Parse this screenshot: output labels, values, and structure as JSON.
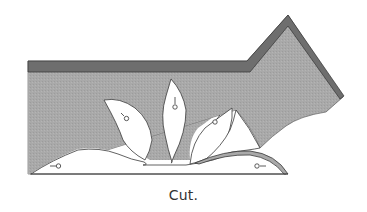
{
  "figure": {
    "caption": "Cut.",
    "colors": {
      "fill": "#a9a9a9",
      "band": "#6e6e6e",
      "outline": "#3a3a3a",
      "cutout": "#ffffff",
      "caption": "#333333"
    },
    "markers": [
      {
        "id": "left-base-marker",
        "symbol": "--o"
      },
      {
        "id": "left-petal-marker",
        "symbol": "-o"
      },
      {
        "id": "center-petal-marker",
        "symbol": "|o"
      },
      {
        "id": "right-petal-marker",
        "symbol": "o/"
      },
      {
        "id": "right-base-marker",
        "symbol": "o--"
      }
    ]
  }
}
